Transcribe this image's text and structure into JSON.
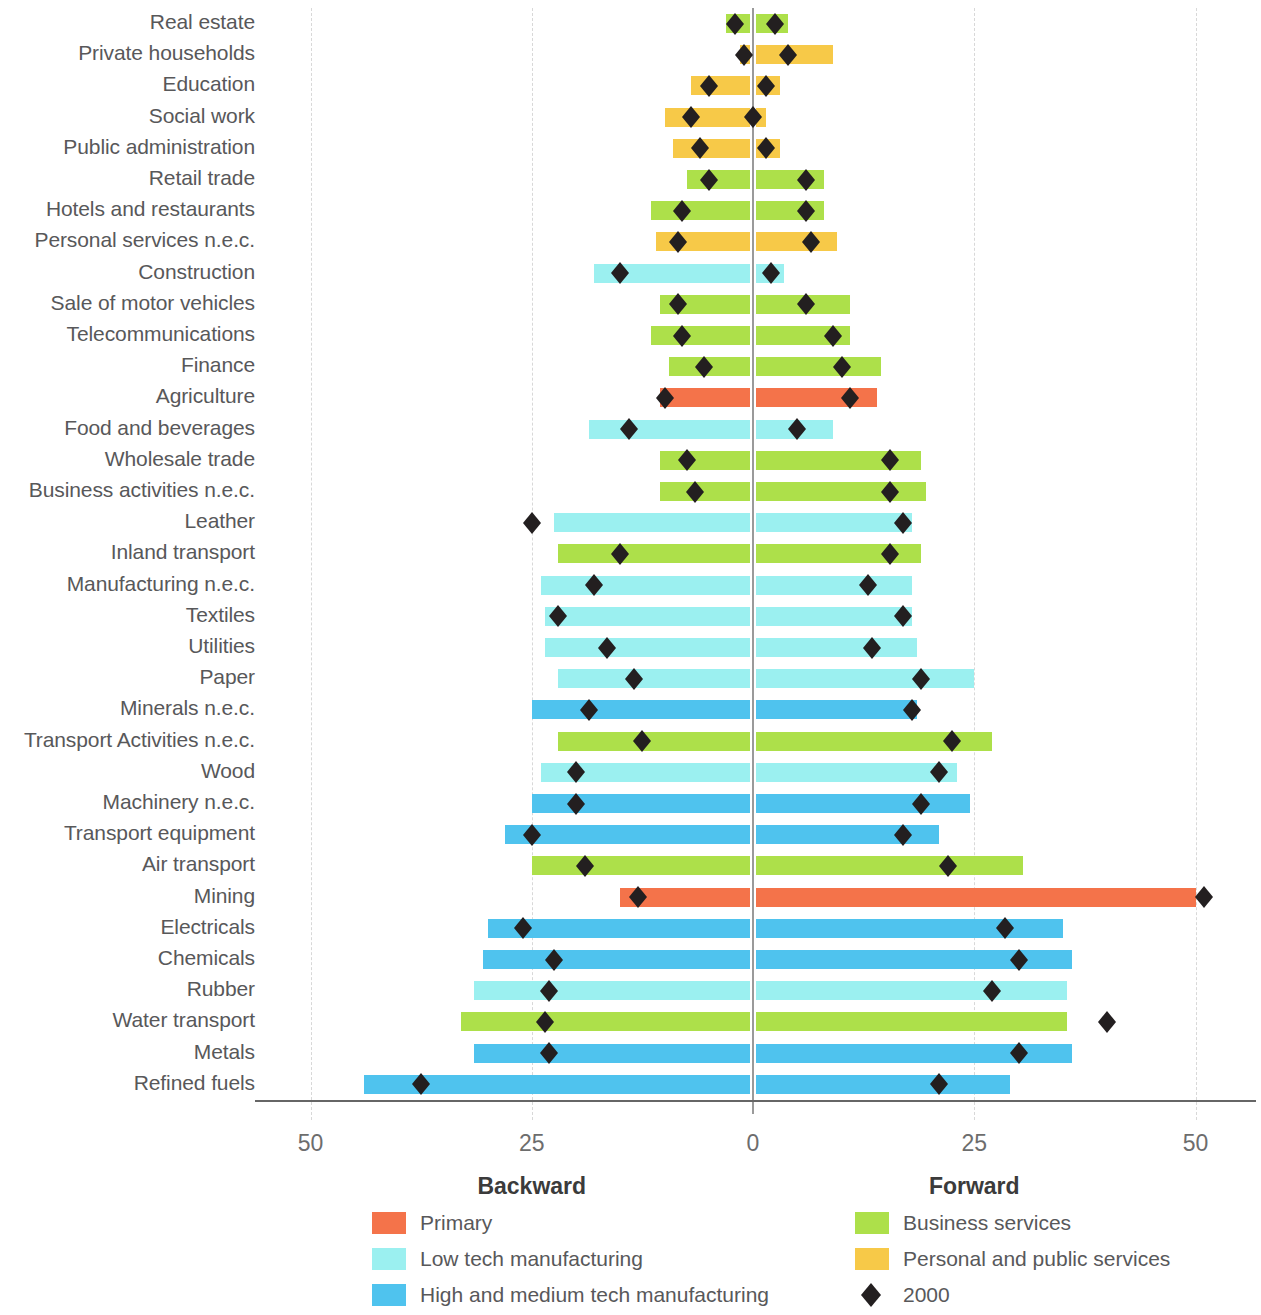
{
  "chart_data": {
    "type": "bar",
    "title": "",
    "subtitle": "",
    "orientation": "horizontal-diverging",
    "xlabel_left": "Backward",
    "xlabel_right": "Forward",
    "ylabel": "",
    "xlim": [
      -50,
      50
    ],
    "xticks": [
      -50,
      -25,
      0,
      25,
      50
    ],
    "xticklabels": [
      "50",
      "25",
      "0",
      "25",
      "50"
    ],
    "grid": "vertical dashed at -50, -25, 25, 50; solid zero line at 0",
    "legend_position": "below-plot, two columns",
    "marker_series_name": "2000",
    "colors": {
      "primary": "#F4734A",
      "low_tech_manufacturing": "#9BF0F0",
      "high_and_medium_tech_manufacturing": "#4FC3EE",
      "business_services": "#ADE04A",
      "personal_and_public_services": "#F7C948",
      "marker": "#231f20",
      "axis": "#666666",
      "gridline": "#d8d8d8",
      "zeroline": "#9a9a9a",
      "label_text": "#58585a"
    },
    "categories": [
      "Real estate",
      "Private households",
      "Education",
      "Social work",
      "Public administration",
      "Retail trade",
      "Hotels and restaurants",
      "Personal services n.e.c.",
      "Construction",
      "Sale of motor vehicles",
      "Telecommunications",
      "Finance",
      "Agriculture",
      "Food and beverages",
      "Wholesale trade",
      "Business activities n.e.c.",
      "Leather",
      "Inland transport",
      "Manufacturing n.e.c.",
      "Textiles",
      "Utilities",
      "Paper",
      "Minerals n.e.c.",
      "Transport Activities n.e.c.",
      "Wood",
      "Machinery n.e.c.",
      "Transport equipment",
      "Air transport",
      "Mining",
      "Electricals",
      "Chemicals",
      "Rubber",
      "Water transport",
      "Metals",
      "Refined fuels"
    ],
    "rows": [
      {
        "label": "Real estate",
        "group": "business_services",
        "backward": 3.0,
        "forward": 4.0,
        "marker_backward": -2.0,
        "marker_forward": 2.5
      },
      {
        "label": "Private households",
        "group": "personal_and_public_services",
        "backward": 1.5,
        "forward": 9.0,
        "marker_backward": -1.0,
        "marker_forward": 4.0
      },
      {
        "label": "Education",
        "group": "personal_and_public_services",
        "backward": 7.0,
        "forward": 3.0,
        "marker_backward": -5.0,
        "marker_forward": 1.5
      },
      {
        "label": "Social work",
        "group": "personal_and_public_services",
        "backward": 10.0,
        "forward": 1.5,
        "marker_backward": -7.0,
        "marker_forward": 0.0
      },
      {
        "label": "Public administration",
        "group": "personal_and_public_services",
        "backward": 9.0,
        "forward": 3.0,
        "marker_backward": -6.0,
        "marker_forward": 1.5
      },
      {
        "label": "Retail trade",
        "group": "business_services",
        "backward": 7.5,
        "forward": 8.0,
        "marker_backward": -5.0,
        "marker_forward": 6.0
      },
      {
        "label": "Hotels and restaurants",
        "group": "business_services",
        "backward": 11.5,
        "forward": 8.0,
        "marker_backward": -8.0,
        "marker_forward": 6.0
      },
      {
        "label": "Personal services n.e.c.",
        "group": "personal_and_public_services",
        "backward": 11.0,
        "forward": 9.5,
        "marker_backward": -8.5,
        "marker_forward": 6.5
      },
      {
        "label": "Construction",
        "group": "low_tech_manufacturing",
        "backward": 18.0,
        "forward": 3.5,
        "marker_backward": -15.0,
        "marker_forward": 2.0
      },
      {
        "label": "Sale of motor vehicles",
        "group": "business_services",
        "backward": 10.5,
        "forward": 11.0,
        "marker_backward": -8.5,
        "marker_forward": 6.0
      },
      {
        "label": "Telecommunications",
        "group": "business_services",
        "backward": 11.5,
        "forward": 11.0,
        "marker_backward": -8.0,
        "marker_forward": 9.0
      },
      {
        "label": "Finance",
        "group": "business_services",
        "backward": 9.5,
        "forward": 14.5,
        "marker_backward": -5.5,
        "marker_forward": 10.0
      },
      {
        "label": "Agriculture",
        "group": "primary",
        "backward": 10.5,
        "forward": 14.0,
        "marker_backward": -10.0,
        "marker_forward": 11.0
      },
      {
        "label": "Food and beverages",
        "group": "low_tech_manufacturing",
        "backward": 18.5,
        "forward": 9.0,
        "marker_backward": -14.0,
        "marker_forward": 5.0
      },
      {
        "label": "Wholesale trade",
        "group": "business_services",
        "backward": 10.5,
        "forward": 19.0,
        "marker_backward": -7.5,
        "marker_forward": 15.5
      },
      {
        "label": "Business activities n.e.c.",
        "group": "business_services",
        "backward": 10.5,
        "forward": 19.5,
        "marker_backward": -6.5,
        "marker_forward": 15.5
      },
      {
        "label": "Leather",
        "group": "low_tech_manufacturing",
        "backward": 22.5,
        "forward": 18.0,
        "marker_backward": -25.0,
        "marker_forward": 17.0
      },
      {
        "label": "Inland transport",
        "group": "business_services",
        "backward": 22.0,
        "forward": 19.0,
        "marker_backward": -15.0,
        "marker_forward": 15.5
      },
      {
        "label": "Manufacturing n.e.c.",
        "group": "low_tech_manufacturing",
        "backward": 24.0,
        "forward": 18.0,
        "marker_backward": -18.0,
        "marker_forward": 13.0
      },
      {
        "label": "Textiles",
        "group": "low_tech_manufacturing",
        "backward": 23.5,
        "forward": 18.0,
        "marker_backward": -22.0,
        "marker_forward": 17.0
      },
      {
        "label": "Utilities",
        "group": "low_tech_manufacturing",
        "backward": 23.5,
        "forward": 18.5,
        "marker_backward": -16.5,
        "marker_forward": 13.5
      },
      {
        "label": "Paper",
        "group": "low_tech_manufacturing",
        "backward": 22.0,
        "forward": 25.0,
        "marker_backward": -13.5,
        "marker_forward": 19.0
      },
      {
        "label": "Minerals n.e.c.",
        "group": "high_and_medium_tech_manufacturing",
        "backward": 25.0,
        "forward": 18.5,
        "marker_backward": -18.5,
        "marker_forward": 18.0
      },
      {
        "label": "Transport Activities n.e.c.",
        "group": "business_services",
        "backward": 22.0,
        "forward": 27.0,
        "marker_backward": -12.5,
        "marker_forward": 22.5
      },
      {
        "label": "Wood",
        "group": "low_tech_manufacturing",
        "backward": 24.0,
        "forward": 23.0,
        "marker_backward": -20.0,
        "marker_forward": 21.0
      },
      {
        "label": "Machinery n.e.c.",
        "group": "high_and_medium_tech_manufacturing",
        "backward": 25.0,
        "forward": 24.5,
        "marker_backward": -20.0,
        "marker_forward": 19.0
      },
      {
        "label": "Transport equipment",
        "group": "high_and_medium_tech_manufacturing",
        "backward": 28.0,
        "forward": 21.0,
        "marker_backward": -25.0,
        "marker_forward": 17.0
      },
      {
        "label": "Air transport",
        "group": "business_services",
        "backward": 25.0,
        "forward": 30.5,
        "marker_backward": -19.0,
        "marker_forward": 22.0
      },
      {
        "label": "Mining",
        "group": "primary",
        "backward": 15.0,
        "forward": 50.0,
        "marker_backward": -13.0,
        "marker_forward": 51.0
      },
      {
        "label": "Electricals",
        "group": "high_and_medium_tech_manufacturing",
        "backward": 30.0,
        "forward": 35.0,
        "marker_backward": -26.0,
        "marker_forward": 28.5
      },
      {
        "label": "Chemicals",
        "group": "high_and_medium_tech_manufacturing",
        "backward": 30.5,
        "forward": 36.0,
        "marker_backward": -22.5,
        "marker_forward": 30.0
      },
      {
        "label": "Rubber",
        "group": "low_tech_manufacturing",
        "backward": 31.5,
        "forward": 35.5,
        "marker_backward": -23.0,
        "marker_forward": 27.0
      },
      {
        "label": "Water transport",
        "group": "business_services",
        "backward": 33.0,
        "forward": 35.5,
        "marker_backward": -23.5,
        "marker_forward": 40.0
      },
      {
        "label": "Metals",
        "group": "high_and_medium_tech_manufacturing",
        "backward": 31.5,
        "forward": 36.0,
        "marker_backward": -23.0,
        "marker_forward": 30.0
      },
      {
        "label": "Refined fuels",
        "group": "high_and_medium_tech_manufacturing",
        "backward": 44.0,
        "forward": 29.0,
        "marker_backward": -37.5,
        "marker_forward": 21.0
      }
    ]
  },
  "legend": {
    "items": [
      {
        "label": "Primary",
        "color_key": "primary",
        "type": "swatch",
        "column": 0,
        "row": 0
      },
      {
        "label": "Low tech manufacturing",
        "color_key": "low_tech_manufacturing",
        "type": "swatch",
        "column": 0,
        "row": 1
      },
      {
        "label": "High and medium tech manufacturing",
        "color_key": "high_and_medium_tech_manufacturing",
        "type": "swatch",
        "column": 0,
        "row": 2
      },
      {
        "label": "Business services",
        "color_key": "business_services",
        "type": "swatch",
        "column": 1,
        "row": 0
      },
      {
        "label": "Personal and public services",
        "color_key": "personal_and_public_services",
        "type": "swatch",
        "column": 1,
        "row": 1
      },
      {
        "label": "2000",
        "color_key": "marker",
        "type": "diamond",
        "column": 1,
        "row": 2
      }
    ]
  }
}
